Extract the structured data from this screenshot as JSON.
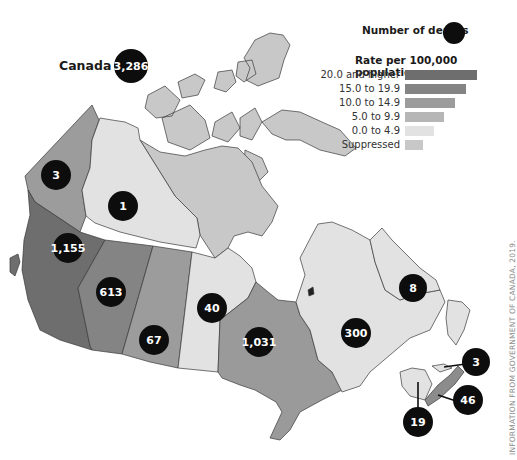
{
  "title": "Number of deaths",
  "legend": {
    "deaths_label": "Number of deaths",
    "rate_title": "Rate per 100,000 population",
    "categories": [
      {
        "label": "20.0 and higher",
        "color": "#6e6e6e"
      },
      {
        "label": "15.0 to 19.9",
        "color": "#848484"
      },
      {
        "label": "10.0 to 14.9",
        "color": "#9c9c9c"
      },
      {
        "label": "5.0 to 9.9",
        "color": "#b6b6b6"
      },
      {
        "label": "0.0 to 4.9",
        "color": "#e2e2e2"
      },
      {
        "label": "Suppressed",
        "color": "#c8c8c8"
      }
    ]
  },
  "national": {
    "label": "Canada",
    "deaths": "3,286"
  },
  "regions": [
    {
      "name": "Yukon",
      "deaths": "3",
      "rate_category": "10.0 to 14.9",
      "color": "#9c9c9c"
    },
    {
      "name": "Northwest Territories",
      "deaths": "1",
      "rate_category": "0.0 to 4.9",
      "color": "#e2e2e2"
    },
    {
      "name": "Nunavut",
      "deaths": "",
      "rate_category": "Suppressed",
      "color": "#c8c8c8"
    },
    {
      "name": "British Columbia",
      "deaths": "1,155",
      "rate_category": "20.0 and higher",
      "color": "#6e6e6e"
    },
    {
      "name": "Alberta",
      "deaths": "613",
      "rate_category": "15.0 to 19.9",
      "color": "#848484"
    },
    {
      "name": "Saskatchewan",
      "deaths": "67",
      "rate_category": "5.0 to 9.9",
      "color": "#9c9c9c"
    },
    {
      "name": "Manitoba",
      "deaths": "40",
      "rate_category": "0.0 to 4.9",
      "color": "#e2e2e2"
    },
    {
      "name": "Ontario",
      "deaths": "1,031",
      "rate_category": "5.0 to 9.9",
      "color": "#9a9a9a"
    },
    {
      "name": "Quebec",
      "deaths": "300",
      "rate_category": "0.0 to 4.9",
      "color": "#e2e2e2"
    },
    {
      "name": "Newfoundland and Labrador",
      "deaths": "8",
      "rate_category": "0.0 to 4.9",
      "color": "#e2e2e2"
    },
    {
      "name": "New Brunswick",
      "deaths": "19",
      "rate_category": "0.0 to 4.9",
      "color": "#e2e2e2"
    },
    {
      "name": "Prince Edward Island",
      "deaths": "3",
      "rate_category": "0.0 to 4.9",
      "color": "#e2e2e2"
    },
    {
      "name": "Nova Scotia",
      "deaths": "46",
      "rate_category": "5.0 to 9.9",
      "color": "#8c8c8c"
    }
  ],
  "credit": "INFORMATION FROM GOVERNMENT OF CANADA, 2019."
}
